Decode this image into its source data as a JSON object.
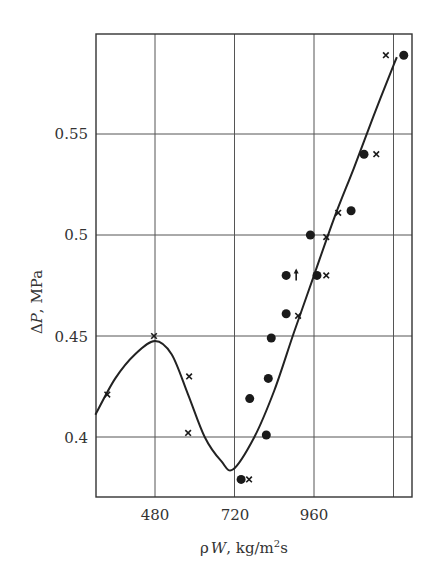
{
  "chart_data": {
    "type": "scatter",
    "title": "",
    "xlabel": "ρW, kg/m²s",
    "ylabel": "ΔP, MPa",
    "xlim": [
      300,
      1240
    ],
    "ylim": [
      0.365,
      0.595
    ],
    "x_ticks": [
      480,
      720,
      960
    ],
    "x_gridlines": [
      480,
      720,
      960,
      1200
    ],
    "y_ticks": [
      0.4,
      0.45,
      0.5,
      0.55
    ],
    "y_tick_labels": [
      "0.4",
      "0.45",
      "0.5",
      "0.55"
    ],
    "grid": true,
    "legend": null,
    "series": [
      {
        "name": "circles",
        "marker": "filled-circle",
        "points": [
          {
            "x": 740,
            "y": 0.379
          },
          {
            "x": 766,
            "y": 0.419
          },
          {
            "x": 816,
            "y": 0.401
          },
          {
            "x": 822,
            "y": 0.429
          },
          {
            "x": 831,
            "y": 0.449
          },
          {
            "x": 876,
            "y": 0.461
          },
          {
            "x": 876,
            "y": 0.48,
            "note": "upward arrow"
          },
          {
            "x": 949,
            "y": 0.5
          },
          {
            "x": 969,
            "y": 0.48
          },
          {
            "x": 1072,
            "y": 0.512
          },
          {
            "x": 1111,
            "y": 0.54
          },
          {
            "x": 1231,
            "y": 0.589
          }
        ]
      },
      {
        "name": "crosses",
        "marker": "x",
        "points": [
          {
            "x": 336,
            "y": 0.421
          },
          {
            "x": 477,
            "y": 0.45
          },
          {
            "x": 583,
            "y": 0.43
          },
          {
            "x": 580,
            "y": 0.402
          },
          {
            "x": 764,
            "y": 0.379
          },
          {
            "x": 912,
            "y": 0.46
          },
          {
            "x": 997,
            "y": 0.499
          },
          {
            "x": 997,
            "y": 0.48
          },
          {
            "x": 1033,
            "y": 0.511
          },
          {
            "x": 1148,
            "y": 0.54
          },
          {
            "x": 1177,
            "y": 0.589
          }
        ]
      },
      {
        "name": "fitted curve",
        "type": "line",
        "points": [
          {
            "x": 300,
            "y": 0.411
          },
          {
            "x": 360,
            "y": 0.429
          },
          {
            "x": 420,
            "y": 0.441
          },
          {
            "x": 480,
            "y": 0.4475
          },
          {
            "x": 530,
            "y": 0.441
          },
          {
            "x": 580,
            "y": 0.421
          },
          {
            "x": 630,
            "y": 0.4
          },
          {
            "x": 680,
            "y": 0.388
          },
          {
            "x": 716,
            "y": 0.384
          },
          {
            "x": 780,
            "y": 0.4
          },
          {
            "x": 840,
            "y": 0.423
          },
          {
            "x": 900,
            "y": 0.452
          },
          {
            "x": 960,
            "y": 0.48
          },
          {
            "x": 1020,
            "y": 0.508
          },
          {
            "x": 1080,
            "y": 0.533
          },
          {
            "x": 1140,
            "y": 0.559
          },
          {
            "x": 1200,
            "y": 0.584
          },
          {
            "x": 1210,
            "y": 0.588
          }
        ]
      }
    ]
  },
  "labels": {
    "y_axis_title_delta": "Δ",
    "y_axis_title_var": "P",
    "y_axis_title_unit": ", MPa",
    "x_axis_title_rho": "ρ",
    "x_axis_title_var": "W",
    "x_axis_title_unit": ", kg/m",
    "x_axis_title_sup": "2",
    "x_axis_title_end": "s",
    "x_tick_480": "480",
    "x_tick_720": "720",
    "x_tick_960": "960",
    "y_tick_040": "0.4",
    "y_tick_045": "0.45",
    "y_tick_050": "0.5",
    "y_tick_055": "0.55"
  }
}
